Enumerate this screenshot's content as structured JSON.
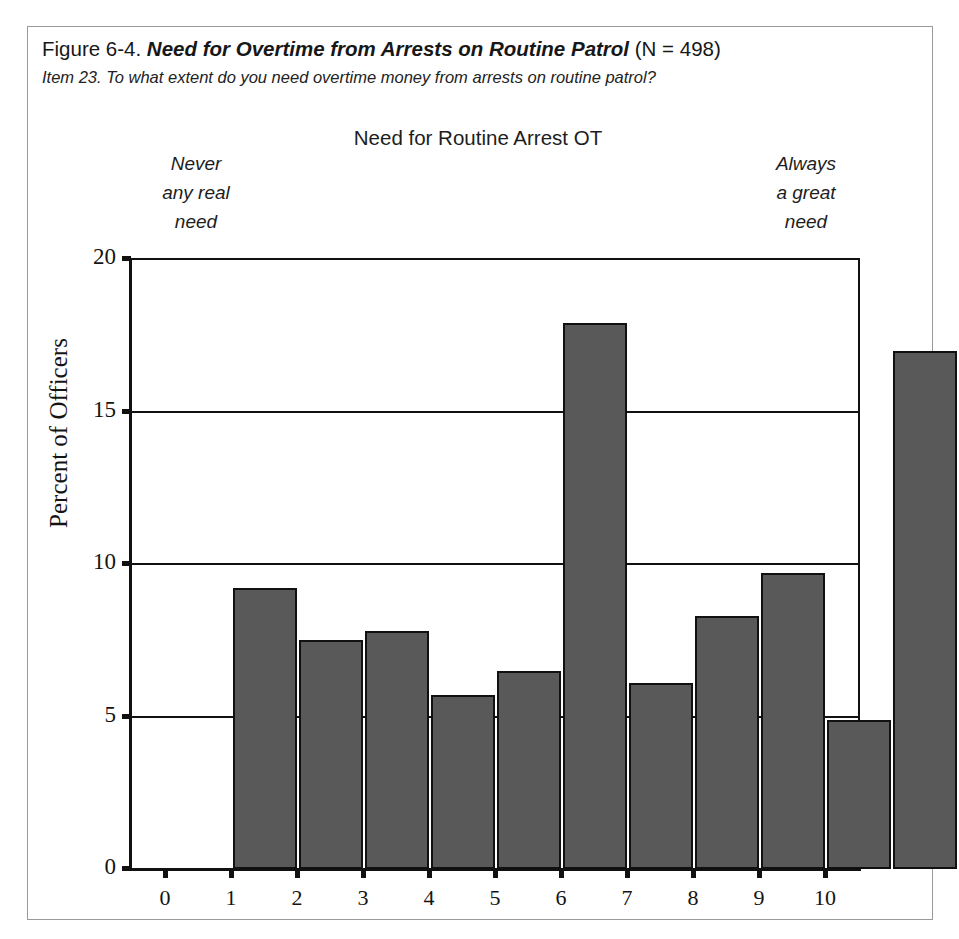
{
  "figure": {
    "number": "Figure 6-4.",
    "title": "Need for Overtime from Arrests on Routine Patrol",
    "n_label": "(N = 498)",
    "item_line": "Item 23. To what extent do you need overtime money from arrests on routine patrol?"
  },
  "scale": {
    "center_label": "Need for Routine Arrest OT",
    "left_anchor_line1": "Never",
    "left_anchor_line2": "any real",
    "left_anchor_line3": "need",
    "right_anchor_line1": "Always",
    "right_anchor_line2": "a great",
    "right_anchor_line3": "need"
  },
  "colors": {
    "bar_fill": "#595959",
    "bar_stroke": "#111111",
    "axis": "#111111",
    "frame_border": "#9a9a9a",
    "background": "#ffffff"
  },
  "chart_data": {
    "type": "bar",
    "title": "Need for Routine Arrest OT",
    "xlabel": "",
    "ylabel": "Percent of Officers",
    "categories": [
      "0",
      "1",
      "2",
      "3",
      "4",
      "5",
      "6",
      "7",
      "8",
      "9",
      "10"
    ],
    "values": [
      9.2,
      7.5,
      7.8,
      5.7,
      6.5,
      17.9,
      6.1,
      8.3,
      9.7,
      4.9,
      17.0
    ],
    "ylim": [
      0,
      20
    ],
    "yticks": [
      0,
      5,
      10,
      15,
      20
    ],
    "ytick_labels": [
      "0",
      "5",
      "10",
      "15",
      "20"
    ],
    "xticks": [
      0,
      1,
      2,
      3,
      4,
      5,
      6,
      7,
      8,
      9,
      10
    ],
    "grid": "horizontal",
    "legend": "none",
    "n": 498
  }
}
